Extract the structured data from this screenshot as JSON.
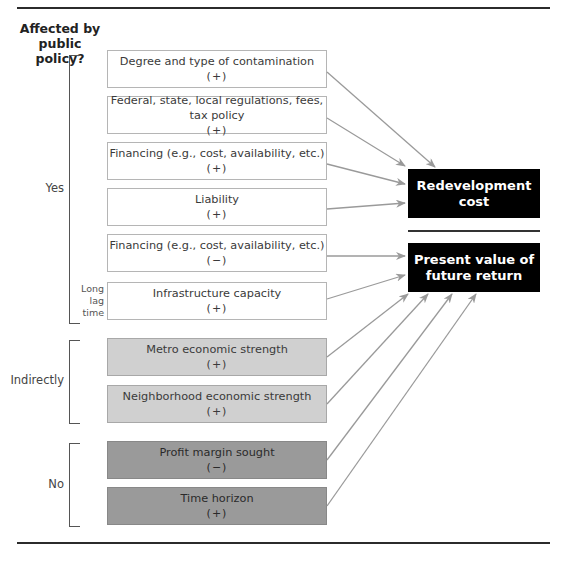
{
  "heading": {
    "line1": "Affected by",
    "line2": "public policy?"
  },
  "groups": [
    {
      "label": "Yes",
      "note": [
        "Long",
        "lag",
        "time"
      ]
    },
    {
      "label": "Indirectly"
    },
    {
      "label": "No"
    }
  ],
  "factors": [
    {
      "name": "Degree and type of contamination",
      "sign": "(+)",
      "group": "Yes",
      "target": "Redevelopment cost"
    },
    {
      "name": "Federal, state, local regulations, fees, tax policy",
      "sign": "(+)",
      "group": "Yes",
      "target": "Redevelopment cost"
    },
    {
      "name": "Financing (e.g., cost, availability, etc.)",
      "sign": "(+)",
      "group": "Yes",
      "target": "Redevelopment cost"
    },
    {
      "name": "Liability",
      "sign": "(+)",
      "group": "Yes",
      "target": "Redevelopment cost"
    },
    {
      "name": "Financing (e.g., cost, availability, etc.)",
      "sign": "(−)",
      "group": "Yes",
      "target": "Present value of future return"
    },
    {
      "name": "Infrastructure capacity",
      "sign": "(+)",
      "group": "Yes",
      "target": "Present value of future return"
    },
    {
      "name": "Metro economic strength",
      "sign": "(+)",
      "group": "Indirectly",
      "target": "Present value of future return"
    },
    {
      "name": "Neighborhood economic strength",
      "sign": "(+)",
      "group": "Indirectly",
      "target": "Present value of future return"
    },
    {
      "name": "Profit margin sought",
      "sign": "(−)",
      "group": "No",
      "target": "Present value of future return"
    },
    {
      "name": "Time horizon",
      "sign": "(+)",
      "group": "No",
      "target": "Present value of future return"
    }
  ],
  "outcomes": [
    {
      "line1": "Redevelopment",
      "line2": "cost"
    },
    {
      "line1": "Present value of",
      "line2": "future return"
    }
  ],
  "colors": {
    "yes_fill": "#ffffff",
    "indirect_fill": "#d0d0d0",
    "no_fill": "#9a9a9a",
    "outcome_fill": "#000000",
    "arrow": "#9a9a9a"
  }
}
